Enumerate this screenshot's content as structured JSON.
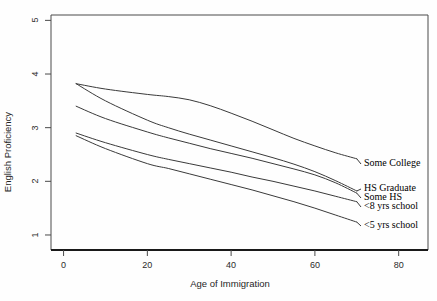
{
  "chart_data": {
    "type": "line",
    "title": "",
    "subtitle": "",
    "xlabel": "Age of Immigration",
    "ylabel": "English Proficiency",
    "xlim": [
      -3,
      87
    ],
    "ylim": [
      0.72,
      5.1
    ],
    "xticks": [
      0,
      20,
      40,
      60,
      80
    ],
    "xtick_labels": [
      "0",
      "20",
      "40",
      "60",
      "80"
    ],
    "yticks": [
      1,
      2,
      3,
      4,
      5
    ],
    "ytick_labels": [
      "1",
      "2",
      "3",
      "4",
      "5"
    ],
    "grid": false,
    "legend_position": "right-inline-labels",
    "x": [
      3,
      10,
      20,
      25,
      30,
      35,
      40,
      45,
      50,
      55,
      60,
      65,
      70
    ],
    "series": [
      {
        "name": "Some College",
        "label": "Some College",
        "values": [
          3.82,
          3.72,
          3.62,
          3.58,
          3.52,
          3.41,
          3.27,
          3.12,
          2.96,
          2.8,
          2.66,
          2.53,
          2.42
        ]
      },
      {
        "name": "HS Graduate",
        "label": "HS Graduate",
        "values": [
          3.82,
          3.5,
          3.14,
          3.0,
          2.88,
          2.77,
          2.66,
          2.55,
          2.44,
          2.32,
          2.18,
          2.01,
          1.82
        ]
      },
      {
        "name": "Some HS",
        "label": "Some HS",
        "values": [
          3.4,
          3.17,
          2.92,
          2.81,
          2.71,
          2.61,
          2.52,
          2.43,
          2.33,
          2.23,
          2.12,
          1.97,
          1.78
        ]
      },
      {
        "name": "<8 yrs school",
        "label": "<8 yrs school",
        "values": [
          2.9,
          2.72,
          2.5,
          2.41,
          2.33,
          2.25,
          2.17,
          2.08,
          2.0,
          1.91,
          1.82,
          1.72,
          1.62
        ]
      },
      {
        "name": "<5 yrs school",
        "label": "<5 yrs school",
        "values": [
          2.85,
          2.61,
          2.33,
          2.24,
          2.14,
          2.04,
          1.94,
          1.84,
          1.73,
          1.62,
          1.5,
          1.37,
          1.24
        ]
      }
    ],
    "colors": {
      "line": "#3a3a3a",
      "axis": "#4a4a4a",
      "text": "#1a1a1a",
      "background": "#fefefe"
    }
  }
}
